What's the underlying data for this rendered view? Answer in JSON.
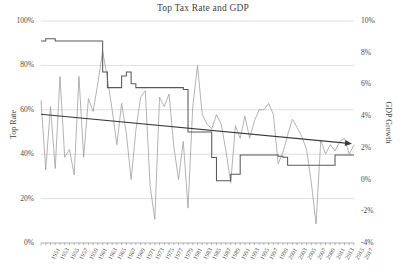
{
  "chart_data": {
    "type": "line",
    "title": "Top Tax Rate and GDP",
    "xlabel": "",
    "ylabel": "Top Rate",
    "ylabel_secondary": "GDP Growth",
    "grid": true,
    "legend": "none",
    "x_axis": {
      "start_year": 1951,
      "end_year": 2017,
      "tick_step": 2,
      "tick_labels": [
        "1951",
        "1953",
        "1955",
        "1957",
        "1959",
        "1961",
        "1963",
        "1965",
        "1967",
        "1969",
        "1971",
        "1973",
        "1975",
        "1977",
        "1979",
        "1981",
        "1983",
        "1985",
        "1987",
        "1989",
        "1991",
        "1993",
        "1995",
        "1997",
        "1999",
        "2001",
        "2003",
        "2005",
        "2007",
        "2009",
        "2011",
        "2013",
        "2015",
        "2017"
      ]
    },
    "y_axis_left": {
      "label": "Top Rate",
      "ticks": [
        "0%",
        "20%",
        "40%",
        "60%",
        "80%",
        "100%"
      ],
      "min": 0,
      "max": 100
    },
    "y_axis_right": {
      "label": "GDP Growth",
      "ticks": [
        "-4%",
        "-2%",
        "0%",
        "2%",
        "4%",
        "6%",
        "8%",
        "10%"
      ],
      "min": -4,
      "max": 10
    },
    "series": [
      {
        "name": "Top Tax Rate",
        "axis": "left",
        "style": "step",
        "color": "#595959",
        "x": [
          1951,
          1952,
          1953,
          1954,
          1955,
          1956,
          1957,
          1958,
          1959,
          1960,
          1961,
          1962,
          1963,
          1964,
          1965,
          1966,
          1967,
          1968,
          1969,
          1970,
          1971,
          1972,
          1973,
          1974,
          1975,
          1976,
          1977,
          1978,
          1979,
          1980,
          1981,
          1982,
          1983,
          1984,
          1985,
          1986,
          1987,
          1988,
          1989,
          1990,
          1991,
          1992,
          1993,
          1994,
          1995,
          1996,
          1997,
          1998,
          1999,
          2000,
          2001,
          2002,
          2003,
          2004,
          2005,
          2006,
          2007,
          2008,
          2009,
          2010,
          2011,
          2012,
          2013,
          2014,
          2015,
          2016,
          2017
        ],
        "values": [
          91,
          92,
          92,
          91,
          91,
          91,
          91,
          91,
          91,
          91,
          91,
          91,
          91,
          77,
          70,
          70,
          70,
          75.25,
          77,
          71.75,
          70,
          70,
          70,
          70,
          70,
          70,
          70,
          70,
          70,
          70,
          69.125,
          50,
          50,
          50,
          50,
          50,
          38.5,
          28,
          28,
          28,
          31,
          31,
          39.6,
          39.6,
          39.6,
          39.6,
          39.6,
          39.6,
          39.6,
          39.6,
          39.1,
          38.6,
          35,
          35,
          35,
          35,
          35,
          35,
          35,
          35,
          35,
          35,
          39.6,
          39.6,
          39.6,
          39.6,
          39.6
        ]
      },
      {
        "name": "GDP Growth",
        "axis": "right",
        "style": "line",
        "color": "#9a9a9a",
        "x": [
          1951,
          1952,
          1953,
          1954,
          1955,
          1956,
          1957,
          1958,
          1959,
          1960,
          1961,
          1962,
          1963,
          1964,
          1965,
          1966,
          1967,
          1968,
          1969,
          1970,
          1971,
          1972,
          1973,
          1974,
          1975,
          1976,
          1977,
          1978,
          1979,
          1980,
          1981,
          1982,
          1983,
          1984,
          1985,
          1986,
          1987,
          1988,
          1989,
          1990,
          1991,
          1992,
          1993,
          1994,
          1995,
          1996,
          1997,
          1998,
          1999,
          2000,
          2001,
          2002,
          2003,
          2004,
          2005,
          2006,
          2007,
          2008,
          2009,
          2010,
          2011,
          2012,
          2013,
          2014,
          2015,
          2016,
          2017
        ],
        "values": [
          5.0,
          0.6,
          4.6,
          0.7,
          6.5,
          1.4,
          1.9,
          0.3,
          6.5,
          1.4,
          5.1,
          4.3,
          6.1,
          8.1,
          6.4,
          4.4,
          2.2,
          4.8,
          2.9,
          0.0,
          3.1,
          5.2,
          5.6,
          -0.4,
          -2.5,
          5.2,
          4.6,
          5.4,
          2.1,
          0.0,
          2.4,
          -1.8,
          4.6,
          7.2,
          4.1,
          3.5,
          3.2,
          4.1,
          3.5,
          1.8,
          -0.2,
          3.4,
          2.6,
          4.0,
          2.6,
          3.7,
          4.4,
          4.4,
          4.8,
          4.1,
          1.0,
          1.7,
          2.8,
          3.8,
          3.3,
          2.7,
          1.9,
          -0.2,
          -2.8,
          2.5,
          1.6,
          2.2,
          1.8,
          2.4,
          2.6,
          1.6,
          2.2
        ]
      },
      {
        "name": "Trend (Top Rate)",
        "axis": "left",
        "style": "trendline-arrow",
        "color": "#3a3a3a",
        "start_value": 58,
        "end_value": 45
      }
    ]
  }
}
